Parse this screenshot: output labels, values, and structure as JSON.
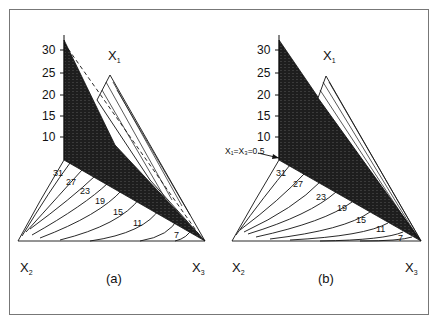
{
  "figure": {
    "panels": [
      {
        "id": "a",
        "caption": "(a)",
        "vertex_labels": {
          "top": "X",
          "top_sub": "1",
          "left": "X",
          "left_sub": "2",
          "right": "X",
          "right_sub": "3"
        },
        "y_axis_ticks": [
          "30",
          "25",
          "20",
          "15",
          "10"
        ],
        "contour_labels": [
          "31",
          "27",
          "23",
          "19",
          "15",
          "11",
          "7"
        ],
        "annotation": ""
      },
      {
        "id": "b",
        "caption": "(b)",
        "vertex_labels": {
          "top": "X",
          "top_sub": "1",
          "left": "X",
          "left_sub": "2",
          "right": "X",
          "right_sub": "3"
        },
        "y_axis_ticks": [
          "30",
          "25",
          "20",
          "15",
          "10"
        ],
        "contour_labels": [
          "31",
          "27",
          "23",
          "19",
          "15",
          "11",
          "7"
        ],
        "annotation": "X₁=X₃=0.5"
      }
    ],
    "colors": {
      "dark_surface": "#1e1e1e",
      "line": "#111111",
      "background": "#ffffff",
      "frame": "#777777"
    }
  }
}
